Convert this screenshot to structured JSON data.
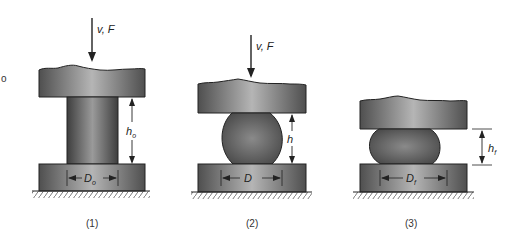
{
  "stray_mark": "o",
  "stages": [
    {
      "caption": "(1)",
      "force_label": "v, F",
      "height_label": "h",
      "height_sub": "o",
      "diameter_label": "D",
      "diameter_sub": "o",
      "shape": "cylinder"
    },
    {
      "caption": "(2)",
      "force_label": "v, F",
      "height_label": "h",
      "height_sub": "",
      "diameter_label": "D",
      "diameter_sub": "",
      "shape": "barrel"
    },
    {
      "caption": "(3)",
      "force_label": "",
      "height_label": "h",
      "height_sub": "f",
      "diameter_label": "D",
      "diameter_sub": "f",
      "shape": "flattened-barrel"
    }
  ],
  "colors": {
    "die_dark": "#555555",
    "die_light": "#b8b8b8",
    "work_dark": "#4a4a4a",
    "work_light": "#9a9a9a",
    "line": "#222222"
  }
}
